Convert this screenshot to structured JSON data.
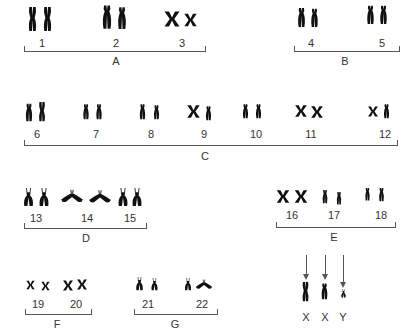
{
  "diagram": {
    "type": "karyotype",
    "groups": [
      {
        "label": "A",
        "chromosomes": [
          "1",
          "2",
          "3"
        ]
      },
      {
        "label": "B",
        "chromosomes": [
          "4",
          "5"
        ]
      },
      {
        "label": "C",
        "chromosomes": [
          "6",
          "7",
          "8",
          "9",
          "10",
          "11",
          "12"
        ]
      },
      {
        "label": "D",
        "chromosomes": [
          "13",
          "14",
          "15"
        ]
      },
      {
        "label": "E",
        "chromosomes": [
          "16",
          "17",
          "18"
        ]
      },
      {
        "label": "F",
        "chromosomes": [
          "19",
          "20"
        ]
      },
      {
        "label": "G",
        "chromosomes": [
          "21",
          "22"
        ]
      }
    ],
    "sex_chromosomes": [
      "X",
      "X",
      "Y"
    ]
  }
}
